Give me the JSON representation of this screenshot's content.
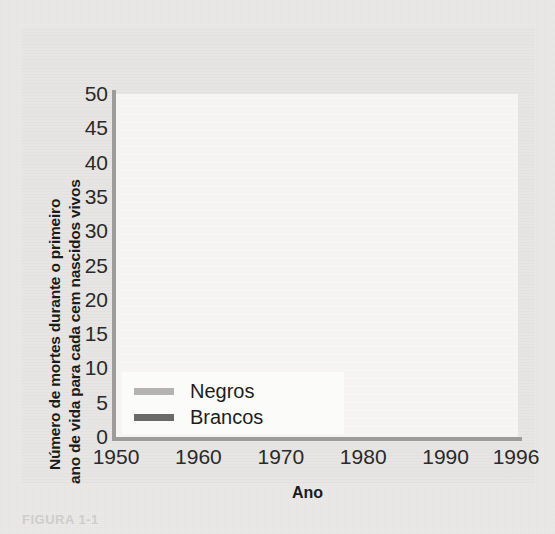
{
  "figure": {
    "caption": "FIGURA 1-1",
    "xaxis": {
      "title": "Ano",
      "ticks": [
        "1950",
        "1960",
        "1970",
        "1980",
        "1990",
        "1996"
      ]
    },
    "yaxis": {
      "title_line1": "Número de mortes durante o primeiro",
      "title_line2": "ano de vida para cada cem nascidos vivos",
      "ticks": [
        "50",
        "45",
        "40",
        "35",
        "30",
        "25",
        "20",
        "15",
        "10",
        "5",
        "0"
      ]
    },
    "legend": {
      "items": [
        {
          "label": "Negros",
          "color": "#b4b3b1"
        },
        {
          "label": "Brancos",
          "color": "#6a6a69"
        }
      ]
    }
  },
  "chart_data": {
    "type": "line",
    "title": "",
    "xlabel": "Ano",
    "ylabel": "Número de mortes durante o primeiro ano de vida para cada cem nascidos vivos",
    "xlim": [
      1950,
      1996
    ],
    "ylim": [
      0,
      50
    ],
    "grid": false,
    "legend_position": "inside-bottom-left",
    "xticks": [
      1950,
      1960,
      1970,
      1980,
      1990,
      1996
    ],
    "yticks": [
      0,
      5,
      10,
      15,
      20,
      25,
      30,
      35,
      40,
      45,
      50
    ],
    "x": [
      1952,
      1953,
      1954,
      1955,
      1956,
      1957,
      1958,
      1959,
      1960,
      1961,
      1962,
      1963,
      1964,
      1965,
      1966,
      1967,
      1968,
      1969,
      1970,
      1971,
      1972,
      1973,
      1974,
      1975,
      1976,
      1977,
      1978,
      1979,
      1980,
      1981,
      1982,
      1983,
      1984,
      1985,
      1986,
      1987,
      1988,
      1989,
      1990,
      1991,
      1992,
      1993,
      1994,
      1995,
      1996
    ],
    "series": [
      {
        "name": "Negros",
        "color": "#b4b3b1",
        "values": [
          45.4,
          45.2,
          46.9,
          43.6,
          44.6,
          42.0,
          45.1,
          42.3,
          44.5,
          42.5,
          45.6,
          46.2,
          44.7,
          44.4,
          44.6,
          41.6,
          42.2,
          43.2,
          42.9,
          41.8,
          40.1,
          37.2,
          34.8,
          32.1,
          29.8,
          28.2,
          27.0,
          25.8,
          24.5,
          23.5,
          22.1,
          19.8,
          18.1,
          17.5,
          17.0,
          16.4,
          15.5,
          14.7,
          14.0,
          13.7,
          13.4,
          13.2,
          13.0,
          12.8,
          12.5
        ]
      },
      {
        "name": "Brancos",
        "color": "#6a6a69",
        "values": [
          24.0,
          23.6,
          23.3,
          23.2,
          23.1,
          23.1,
          22.6,
          22.4,
          22.3,
          21.7,
          21.0,
          20.3,
          19.8,
          19.5,
          19.1,
          18.4,
          18.0,
          17.4,
          16.8,
          15.9,
          15.0,
          14.1,
          13.3,
          13.1,
          12.6,
          12.3,
          11.7,
          11.1,
          10.3,
          9.4,
          8.5,
          7.4,
          7.2,
          7.1,
          6.9,
          6.6,
          6.3,
          5.9,
          5.4,
          5.9,
          5.9,
          5.8,
          5.7,
          5.6,
          5.0
        ]
      }
    ]
  }
}
